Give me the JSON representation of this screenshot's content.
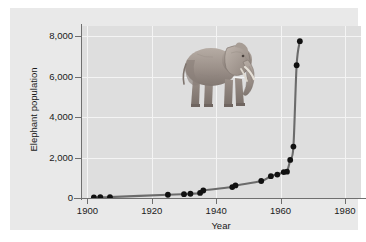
{
  "chart_data": {
    "type": "line",
    "title": "",
    "subtitle": "",
    "xlabel": "Year",
    "ylabel": "Elephant population",
    "xlim": [
      1898,
      1985
    ],
    "ylim": [
      0,
      8500
    ],
    "xticks": [
      1900,
      1920,
      1940,
      1960,
      1980
    ],
    "xtick_labels": [
      "1900",
      "1920",
      "1940",
      "1960",
      "1980"
    ],
    "yticks": [
      0,
      2000,
      4000,
      6000,
      8000
    ],
    "ytick_labels": [
      "0",
      "2,000",
      "4,000",
      "6,000",
      "8,000"
    ],
    "grid": true,
    "grid_color": "#f4f4f4",
    "legend": "none",
    "marker": "filled-circle",
    "marker_color": "#111111",
    "line_color": "#6b6b6b",
    "plot_background": "#dedede",
    "figure_background": "#e9e9e9",
    "x": [
      1902,
      1904,
      1907,
      1925,
      1930,
      1932,
      1935,
      1936,
      1945,
      1946,
      1954,
      1957,
      1959,
      1961,
      1962,
      1963,
      1964,
      1965,
      1966
    ],
    "values": [
      30,
      40,
      45,
      160,
      190,
      210,
      250,
      370,
      540,
      620,
      840,
      1080,
      1160,
      1280,
      1300,
      1880,
      2540,
      6560,
      7750
    ],
    "series": [
      {
        "name": "Elephant population",
        "points": [
          {
            "year": 1902,
            "population": 30
          },
          {
            "year": 1904,
            "population": 40
          },
          {
            "year": 1907,
            "population": 45
          },
          {
            "year": 1925,
            "population": 160
          },
          {
            "year": 1930,
            "population": 190
          },
          {
            "year": 1932,
            "population": 210
          },
          {
            "year": 1935,
            "population": 250
          },
          {
            "year": 1936,
            "population": 370
          },
          {
            "year": 1945,
            "population": 540
          },
          {
            "year": 1946,
            "population": 620
          },
          {
            "year": 1954,
            "population": 840
          },
          {
            "year": 1957,
            "population": 1080
          },
          {
            "year": 1959,
            "population": 1160
          },
          {
            "year": 1961,
            "population": 1280
          },
          {
            "year": 1962,
            "population": 1300
          },
          {
            "year": 1963,
            "population": 1880
          },
          {
            "year": 1964,
            "population": 2540
          },
          {
            "year": 1965,
            "population": 6560
          },
          {
            "year": 1966,
            "population": 7750
          }
        ]
      }
    ],
    "annotations": [
      {
        "name": "elephant-illustration",
        "description": "Grayscale illustration of an African elephant facing right"
      }
    ]
  }
}
